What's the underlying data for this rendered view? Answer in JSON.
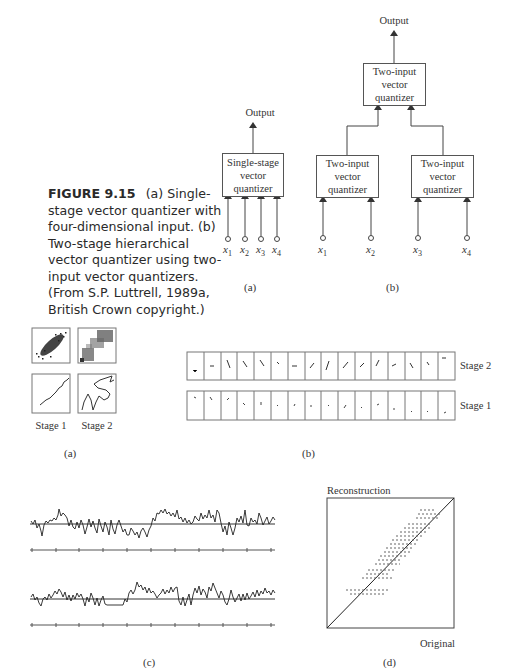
{
  "caption": {
    "figure_number": "FIGURE 9.15",
    "text": "(a) Single-stage vector quantizer with four-dimensional input. (b) Two-stage hierarchical vector quantizer using two-input vector quantizers. (From S.P. Luttrell, 1989a, British Crown copyright.)"
  },
  "top_a": {
    "output_label": "Output",
    "box_label": [
      "Single-stage",
      "vector",
      "quantizer"
    ],
    "inputs": [
      "x",
      "x",
      "x",
      "x"
    ],
    "input_subs": [
      "1",
      "2",
      "3",
      "4"
    ],
    "panel_label": "(a)"
  },
  "top_b": {
    "output_label": "Output",
    "top_box": [
      "Two-input",
      "vector",
      "quantizer"
    ],
    "left_box": [
      "Two-input",
      "vector",
      "quantizer"
    ],
    "right_box": [
      "Two-input",
      "vector",
      "quantizer"
    ],
    "inputs": [
      "x",
      "x",
      "x",
      "x"
    ],
    "input_subs": [
      "1",
      "2",
      "3",
      "4"
    ],
    "panel_label": "(b)"
  },
  "mid_a": {
    "stage_labels": [
      "Stage 1",
      "Stage 2"
    ],
    "panel_label": "(a)"
  },
  "mid_b": {
    "row_labels": [
      "Stage 2",
      "Stage 1"
    ],
    "cell_count": 16,
    "panel_label": "(b)"
  },
  "bottom_c": {
    "panel_label": "(c)",
    "tick_count": 11
  },
  "bottom_d": {
    "y_label": "Reconstruction",
    "x_label": "Original",
    "panel_label": "(d)"
  }
}
